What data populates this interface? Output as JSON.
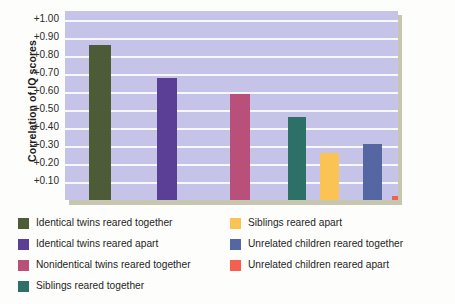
{
  "chart_data": {
    "type": "bar",
    "title": "",
    "xlabel": "",
    "ylabel": "Correlation of IQ scores",
    "ylim": [
      0,
      1.05
    ],
    "grid": true,
    "legend_position": "bottom",
    "ytick_labels": [
      "+1.00",
      "+0.90",
      "+0.80",
      "+0.70",
      "+0.60",
      "+0.50",
      "+0.40",
      "+0.30",
      "+0.20",
      "+0.10"
    ],
    "ytick_values": [
      1.0,
      0.9,
      0.8,
      0.7,
      0.6,
      0.5,
      0.4,
      0.3,
      0.2,
      0.1
    ],
    "categories": [
      "Identical twins reared together",
      "Identical twins reared apart",
      "Nonidentical twins reared together",
      "Siblings reared together",
      "Siblings reared apart",
      "Unrelated children reared together",
      "Unrelated children reared apart"
    ],
    "values": [
      0.86,
      0.68,
      0.59,
      0.46,
      0.26,
      0.31,
      0.02
    ],
    "colors": [
      "#4d5c36",
      "#5b3e96",
      "#b8507a",
      "#2c7068",
      "#fbc254",
      "#5467a3",
      "#f4604f"
    ],
    "bar_left_px": [
      89,
      157,
      230,
      288,
      320,
      363,
      392
    ],
    "bar_width_px": [
      22,
      20,
      20,
      18,
      19,
      19,
      18
    ]
  },
  "plot": {
    "background_color": "#c6c3e9",
    "gridline_color": "#f7f7fc",
    "shadow_color": "#9a9a72"
  },
  "legend": {
    "left_column": [
      {
        "label": "Identical twins reared together",
        "color": "#4d5c36"
      },
      {
        "label": "Identical twins reared apart",
        "color": "#5b3e96"
      },
      {
        "label": "Nonidentical twins reared together",
        "color": "#b8507a"
      },
      {
        "label": "Siblings reared together",
        "color": "#2c7068"
      }
    ],
    "right_column": [
      {
        "label": "Siblings reared apart",
        "color": "#fbc254"
      },
      {
        "label": "Unrelated children reared together",
        "color": "#5467a3"
      },
      {
        "label": "Unrelated children reared apart",
        "color": "#f4604f"
      }
    ]
  }
}
